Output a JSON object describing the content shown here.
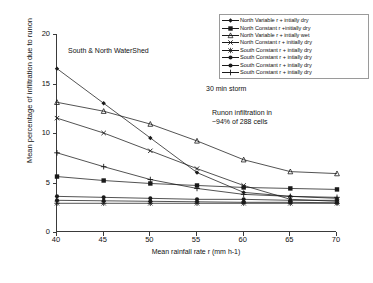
{
  "chart_data": {
    "type": "line",
    "title": "",
    "xlabel": "Mean rainfall rate r (mm h-1)",
    "ylabel": "Mean percentage of infiltration due to runon",
    "x": [
      40,
      45,
      50,
      55,
      60,
      65,
      70
    ],
    "xlim": [
      40,
      70
    ],
    "ylim": [
      0,
      20
    ],
    "xticks": [
      "40",
      "45",
      "50",
      "55",
      "60",
      "65",
      "70"
    ],
    "yticks": [
      "0",
      "5",
      "10",
      "15",
      "20"
    ],
    "grid": false,
    "legend_position": "top-right",
    "annotations": [
      "South & North WaterShed",
      "30 min storm",
      "Runon infiltration in",
      "~94% of 288 cells"
    ],
    "series": [
      {
        "name": "North Variable r + intially dry",
        "marker": "diamond",
        "values": [
          16.5,
          13.0,
          9.5,
          6.0,
          4.0,
          3.6,
          3.4
        ]
      },
      {
        "name": "North Constant r +initially dry",
        "marker": "square",
        "values": [
          5.6,
          5.2,
          4.9,
          4.7,
          4.5,
          4.4,
          4.3
        ]
      },
      {
        "name": "North Variable r + intially wet",
        "marker": "triangle",
        "values": [
          13.1,
          12.2,
          10.9,
          9.2,
          7.3,
          6.1,
          5.9
        ]
      },
      {
        "name": "North Constant r + initially dry",
        "marker": "cross",
        "values": [
          11.5,
          10.0,
          8.2,
          6.4,
          4.7,
          3.3,
          3.1
        ]
      },
      {
        "name": "South Constant r + intially dry",
        "marker": "star",
        "values": [
          2.9,
          2.9,
          2.9,
          2.9,
          2.9,
          2.9,
          2.9
        ]
      },
      {
        "name": "South Constant r + intially dry",
        "marker": "circle",
        "values": [
          3.6,
          3.5,
          3.4,
          3.3,
          3.3,
          3.2,
          3.2
        ]
      },
      {
        "name": "South Constant r + intially dry",
        "marker": "circle2",
        "values": [
          3.2,
          3.15,
          3.1,
          3.05,
          3.0,
          3.0,
          2.95
        ]
      },
      {
        "name": "South Constant r + intially dry",
        "marker": "plus",
        "values": [
          8.0,
          6.6,
          5.3,
          4.4,
          3.8,
          3.6,
          3.5
        ]
      }
    ]
  },
  "legend": {
    "items": [
      {
        "label": "North Variable r + intially dry",
        "marker": "diamond"
      },
      {
        "label": "North Constant r +initially dry",
        "marker": "square"
      },
      {
        "label": "North Variable r + intially wet",
        "marker": "triangle"
      },
      {
        "label": "North Constant r + initially dry",
        "marker": "cross"
      },
      {
        "label": "South Constant r + intially dry",
        "marker": "star"
      },
      {
        "label": "South Constant r + intially dry",
        "marker": "circle"
      },
      {
        "label": "South Constant r + intially dry",
        "marker": "circle2"
      },
      {
        "label": "South Constant r + intially dry",
        "marker": "plus"
      }
    ]
  },
  "colors": {
    "ink": "#1a1a1a",
    "axis": "#3a3a3a",
    "frame": "#9a9a9a",
    "background": "#ffffff"
  }
}
